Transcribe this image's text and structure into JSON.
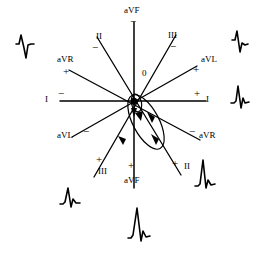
{
  "figure": {
    "name": "hexaxial-reference-diagram",
    "background_color": "#ffffff",
    "stroke_color": "#000000",
    "origin_label": "0"
  },
  "axes": [
    {
      "id": "lead-I",
      "label_negative": "I",
      "label_positive": "I",
      "sign_negative": "−",
      "sign_positive": "+",
      "degrees": 0,
      "x1": 60,
      "y1": 101,
      "x2": 206,
      "y2": 101
    },
    {
      "id": "lead-aVF",
      "label_negative": "aVF",
      "label_positive": "aVF",
      "sign_negative": "−",
      "sign_positive": "+",
      "degrees": 90,
      "x1": 134,
      "y1": 22,
      "x2": 134,
      "y2": 188
    },
    {
      "id": "lead-II",
      "label_negative": "II",
      "label_positive": "II",
      "sign_negative": "−",
      "sign_positive": "+",
      "degrees": 60,
      "x1": 97,
      "y1": 37,
      "x2": 181,
      "y2": 175
    },
    {
      "id": "lead-III",
      "label_negative": "III",
      "label_positive": "III",
      "sign_negative": "−",
      "sign_positive": "+",
      "degrees": 120,
      "x1": 176,
      "y1": 35,
      "x2": 94,
      "y2": 177
    },
    {
      "id": "lead-aVR",
      "label_negative": "aVR",
      "label_positive": "aVR",
      "sign_negative": "−",
      "sign_positive": "+",
      "degrees": -150,
      "x1": 69,
      "y1": 70,
      "x2": 200,
      "y2": 140
    },
    {
      "id": "lead-aVL",
      "label_negative": "aVL",
      "label_positive": "aVL",
      "sign_negative": "−",
      "sign_positive": "+",
      "degrees": -30,
      "x1": 197,
      "y1": 66,
      "x2": 72,
      "y2": 137
    }
  ],
  "labels": {
    "top_avf": "aVF",
    "top_avf_sign": "−",
    "top_ii": "II",
    "top_ii_sign": "−",
    "top_iii": "III",
    "top_iii_sign": "−",
    "upper_left_avr": "aVR",
    "upper_left_avr_sign": "+",
    "upper_right_avl": "aVL",
    "upper_right_avl_sign": "+",
    "left_i": "I",
    "left_i_sign": "−",
    "right_i": "I",
    "right_i_sign": "+",
    "lower_left_avl": "aVL",
    "lower_left_avl_sign": "−",
    "lower_right_avr": "aVR",
    "lower_right_avr_sign": "−",
    "bottom_left_iii": "III",
    "bottom_left_iii_sign": "+",
    "bottom_right_ii": "II",
    "bottom_right_ii_sign": "+",
    "bottom_avf": "aVF",
    "bottom_avf_sign": "+",
    "origin": "0"
  },
  "vector_loop": {
    "name": "qrs-vector-loop",
    "description": "Elongated QRS vector loop directed down and to the right from the origin",
    "arrow_count": 3
  },
  "waveforms": [
    {
      "id": "ecg-trace-left",
      "position": "left",
      "morphology": "small-r-deep-S",
      "x": 20,
      "y": 36
    },
    {
      "id": "ecg-trace-top-right",
      "position": "top-right",
      "morphology": "R-then-S",
      "x": 234,
      "y": 34
    },
    {
      "id": "ecg-trace-right",
      "position": "right",
      "morphology": "tall-R-small-s",
      "x": 234,
      "y": 90
    },
    {
      "id": "ecg-trace-bottom-right",
      "position": "bottom-right",
      "morphology": "tall-R",
      "x": 196,
      "y": 160
    },
    {
      "id": "ecg-trace-bottom-left",
      "position": "bottom-left",
      "morphology": "small-R",
      "x": 60,
      "y": 186
    },
    {
      "id": "ecg-trace-bottom",
      "position": "bottom",
      "morphology": "tall-R",
      "x": 131,
      "y": 206
    }
  ]
}
